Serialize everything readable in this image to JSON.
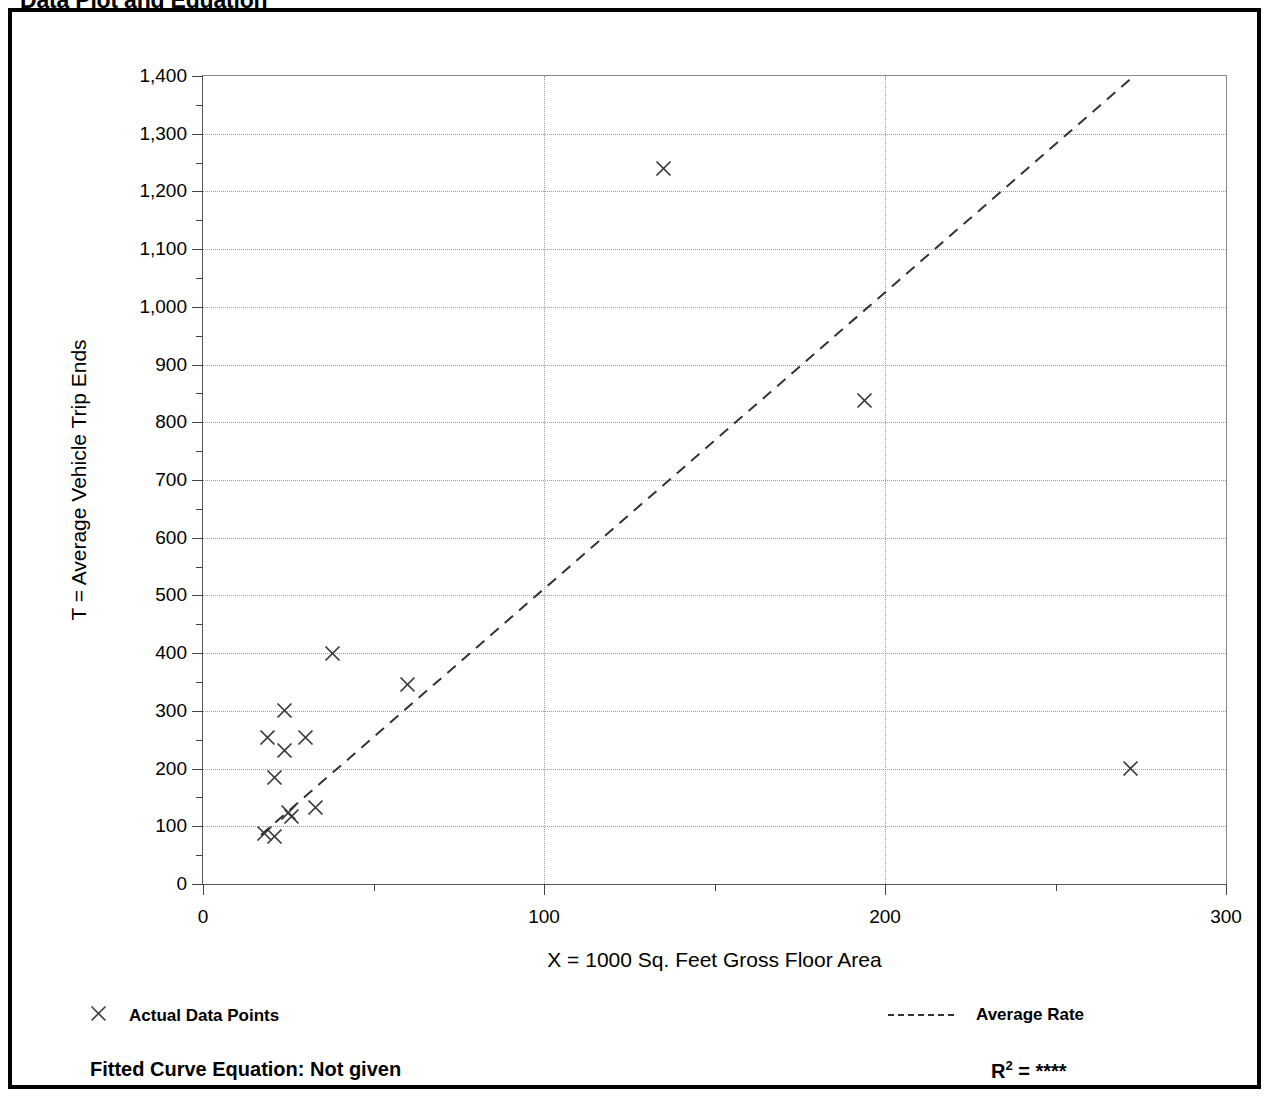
{
  "page": {
    "title": "Data Plot and Equation"
  },
  "chart_data": {
    "type": "scatter",
    "title": "Data Plot and Equation",
    "xlabel": "X = 1000 Sq. Feet Gross Floor Area",
    "ylabel": "T = Average Vehicle Trip Ends",
    "xlim": [
      0,
      300
    ],
    "ylim": [
      0,
      1400
    ],
    "x_major_ticks": [
      0,
      100,
      200,
      300
    ],
    "x_minor_step": 50,
    "y_major_ticks": [
      0,
      100,
      200,
      300,
      400,
      500,
      600,
      700,
      800,
      900,
      1000,
      1100,
      1200,
      1300,
      1400
    ],
    "y_minor_step": 50,
    "x_tick_labels": [
      "0",
      "100",
      "200",
      "300"
    ],
    "y_tick_labels": [
      "0",
      "100",
      "200",
      "300",
      "400",
      "500",
      "600",
      "700",
      "800",
      "900",
      "1,000",
      "1,100",
      "1,200",
      "1,300",
      "1,400"
    ],
    "grid": true,
    "grid_style": "dotted",
    "legend_position": "below-plot",
    "series": [
      {
        "name": "Actual Data Points",
        "type": "scatter",
        "marker": "x",
        "points": [
          {
            "x": 18,
            "y": 88
          },
          {
            "x": 21,
            "y": 82
          },
          {
            "x": 19,
            "y": 254
          },
          {
            "x": 21,
            "y": 184
          },
          {
            "x": 24,
            "y": 301
          },
          {
            "x": 24,
            "y": 231
          },
          {
            "x": 25,
            "y": 124
          },
          {
            "x": 26,
            "y": 117
          },
          {
            "x": 30,
            "y": 253
          },
          {
            "x": 33,
            "y": 133
          },
          {
            "x": 38,
            "y": 400
          },
          {
            "x": 60,
            "y": 346
          },
          {
            "x": 135,
            "y": 1240
          },
          {
            "x": 194,
            "y": 838
          },
          {
            "x": 272,
            "y": 200
          }
        ]
      },
      {
        "name": "Average Rate",
        "type": "line",
        "style": "dashed",
        "endpoints": [
          {
            "x": 17,
            "y": 85
          },
          {
            "x": 273,
            "y": 1400
          }
        ]
      }
    ]
  },
  "legend": {
    "data_points_label": "Actual Data Points",
    "average_rate_label": "Average Rate",
    "marker_icon": "x-marker-icon",
    "line_icon": "dashed-line-icon"
  },
  "footer": {
    "fitted_curve_label": "Fitted Curve Equation:  Not given",
    "r_squared_prefix": "R",
    "r_squared_exponent": "2",
    "r_squared_value": "= ****"
  }
}
